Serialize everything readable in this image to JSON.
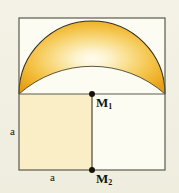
{
  "figure": {
    "type": "geometry-diagram",
    "background_color": "#f2f0e4",
    "frame": {
      "x": 19,
      "y": 18,
      "width": 146,
      "height": 152,
      "stroke_color": "#5c5a4e",
      "fill_color": "#fcfbf1"
    },
    "midline_y": 94,
    "vertical_divider_x": 92,
    "shaded_square": {
      "x": 19,
      "y": 94,
      "width": 73,
      "height": 76,
      "fill_color": "#faeec6"
    },
    "lune": {
      "outer_arc_color": "#3a3528",
      "inner_arc_color": "#3a3528",
      "fill_gradient_center": "#fdf6dc",
      "fill_gradient_mid": "#f7cf5e",
      "fill_gradient_edge": "#e8a21c"
    },
    "points": [
      {
        "id": "M1",
        "label": "M",
        "subscript": "1",
        "cx": 92,
        "cy": 94
      },
      {
        "id": "M2",
        "label": "M",
        "subscript": "2",
        "cx": 92,
        "cy": 170
      }
    ],
    "dimensions": [
      {
        "id": "a-vertical",
        "label": "a",
        "orientation": "vertical"
      },
      {
        "id": "a-horizontal",
        "label": "a",
        "orientation": "horizontal"
      }
    ]
  }
}
